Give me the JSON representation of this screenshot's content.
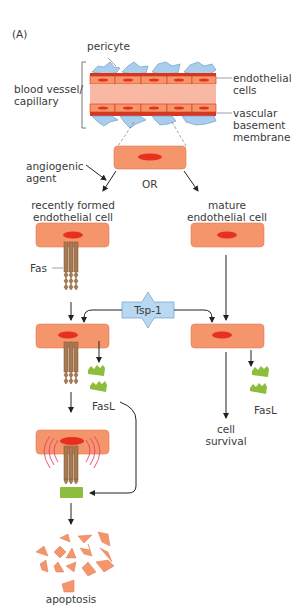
{
  "panel_label": "(A)",
  "vessel": {
    "pericyte_label": "pericyte",
    "vessel_label_line1": "blood vessel/",
    "vessel_label_line2": "capillary",
    "endothelial_label_line1": "endothelial",
    "endothelial_label_line2": "cells",
    "membrane_label_line1": "vascular",
    "membrane_label_line2": "basement",
    "membrane_label_line3": "membrane"
  },
  "branch": {
    "angiogenic_line1": "angiogenic",
    "angiogenic_line2": "agent",
    "or_label": "OR",
    "recent_line1": "recently formed",
    "recent_line2": "endothelial cell",
    "mature_line1": "mature",
    "mature_line2": "endothelial cell"
  },
  "labels": {
    "fas": "Fas",
    "tsp1": "Tsp-1",
    "fasl_left": "FasL",
    "fasl_right": "FasL",
    "survival_line1": "cell",
    "survival_line2": "survival",
    "apoptosis": "apoptosis"
  },
  "colors": {
    "cell_fill": "#f4956b",
    "nucleus": "#e8301e",
    "vessel_wall": "#e04a2c",
    "lumen": "#f8b8a4",
    "pericyte": "#a9cdeb",
    "tsp1_fill": "#b9d8f2",
    "fas": "#a97a52",
    "fasl": "#8dbd3c",
    "signal_ring": "#e8406a",
    "arrow": "#222222"
  }
}
